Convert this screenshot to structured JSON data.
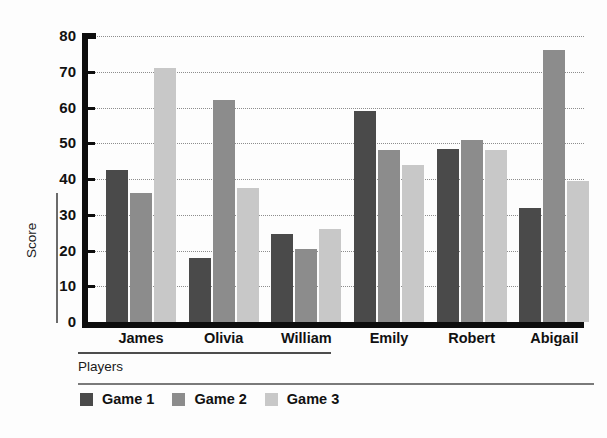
{
  "chart_data": {
    "type": "bar",
    "title": "",
    "subtitle": "",
    "xlabel": "Players",
    "ylabel": "Score",
    "categories": [
      "James",
      "Olivia",
      "William",
      "Emily",
      "Robert",
      "Abigail"
    ],
    "series": [
      {
        "name": "Game 1",
        "color": "#4a4a4a",
        "values": [
          42.5,
          18,
          24.5,
          59,
          48.5,
          32
        ]
      },
      {
        "name": "Game 2",
        "color": "#8c8c8c",
        "values": [
          36,
          62,
          20.5,
          48,
          51,
          76
        ]
      },
      {
        "name": "Game 3",
        "color": "#c8c8c8",
        "values": [
          71,
          37.5,
          26,
          44,
          48,
          39.5
        ]
      }
    ],
    "ylim": [
      0,
      80
    ],
    "yticks": [
      0,
      10,
      20,
      30,
      40,
      50,
      60,
      70,
      80
    ],
    "ytick_labels": [
      "0",
      "10",
      "20",
      "30",
      "40",
      "50",
      "60",
      "70",
      "80"
    ],
    "grid": true,
    "grid_style": "dotted-horizontal",
    "legend_position": "bottom-left",
    "background": "#ffffff"
  }
}
